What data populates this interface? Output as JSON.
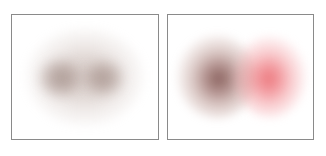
{
  "figure": {
    "background_color": "#ffffff",
    "panel_border_color": "#8a8a8a",
    "panels": [
      {
        "id": "left",
        "name": "panel-left",
        "description": "Diffuse taupe double-lobed density blob, two merged lobes within a broad halo",
        "blobs": [
          {
            "name": "halo",
            "center_x_pct": 50,
            "center_y_pct": 50,
            "width_px": 118,
            "height_px": 98,
            "peak_color": "#967a70",
            "peak_alpha": 0.42
          },
          {
            "name": "lobe-1",
            "center_x_pct": 33,
            "center_y_pct": 51,
            "width_px": 44,
            "height_px": 40,
            "peak_color": "#785c54",
            "peak_alpha": 0.48
          },
          {
            "name": "lobe-2",
            "center_x_pct": 63,
            "center_y_pct": 51,
            "width_px": 42,
            "height_px": 38,
            "peak_color": "#7c6058",
            "peak_alpha": 0.46
          }
        ]
      },
      {
        "id": "right",
        "name": "panel-right",
        "description": "Two separated density blobs: dark maroon lobe at left, bright salmon-red lobe at right",
        "blobs": [
          {
            "name": "dark-lobe",
            "center_x_pct": 34,
            "center_y_pct": 50,
            "width_px": 80,
            "height_px": 84,
            "peak_color": "#683632",
            "peak_alpha": 0.78
          },
          {
            "name": "bright-lobe",
            "center_x_pct": 70,
            "center_y_pct": 50,
            "width_px": 72,
            "height_px": 82,
            "peak_color": "#e75860",
            "peak_alpha": 0.8
          }
        ]
      }
    ]
  },
  "caption": {
    "legend_swatch_color": "#ef6a70",
    "text": "· ·· — · ·· · ··· ·· · —— · ·· ·· ··· ·· · ·· · — ·· · ··· · ·· ··· ·· · ·· ··· · ··"
  },
  "chart_data": {
    "type": "heatmap",
    "title": "",
    "subtitle": "",
    "xlabel": "",
    "ylabel": "",
    "grid": false,
    "legend_position": "below",
    "panel_count": 2,
    "panels": [
      {
        "panel_label": "left",
        "type": "heatmap",
        "description": "Single elongated density distribution with two merged intensity peaks, muted taupe/mauve colormap",
        "peaks": [
          {
            "x": 0.33,
            "y": 0.51,
            "intensity": 0.48,
            "color": "#785c54"
          },
          {
            "x": 0.63,
            "y": 0.51,
            "intensity": 0.46,
            "color": "#7c6058"
          }
        ],
        "extent": {
          "x": [
            0,
            1
          ],
          "y": [
            0,
            1
          ]
        },
        "colormap": "taupe-to-white",
        "intensity_range": [
          0,
          0.5
        ]
      },
      {
        "panel_label": "right",
        "type": "heatmap",
        "description": "Two spatially separated density distributions, dark maroon peak on left and bright salmon-red peak on right",
        "peaks": [
          {
            "x": 0.34,
            "y": 0.5,
            "intensity": 0.78,
            "color": "#683632"
          },
          {
            "x": 0.7,
            "y": 0.5,
            "intensity": 0.8,
            "color": "#e75860"
          }
        ],
        "extent": {
          "x": [
            0,
            1
          ],
          "y": [
            0,
            1
          ]
        },
        "colormap": "maroon-red-to-white",
        "intensity_range": [
          0,
          0.8
        ]
      }
    ]
  }
}
